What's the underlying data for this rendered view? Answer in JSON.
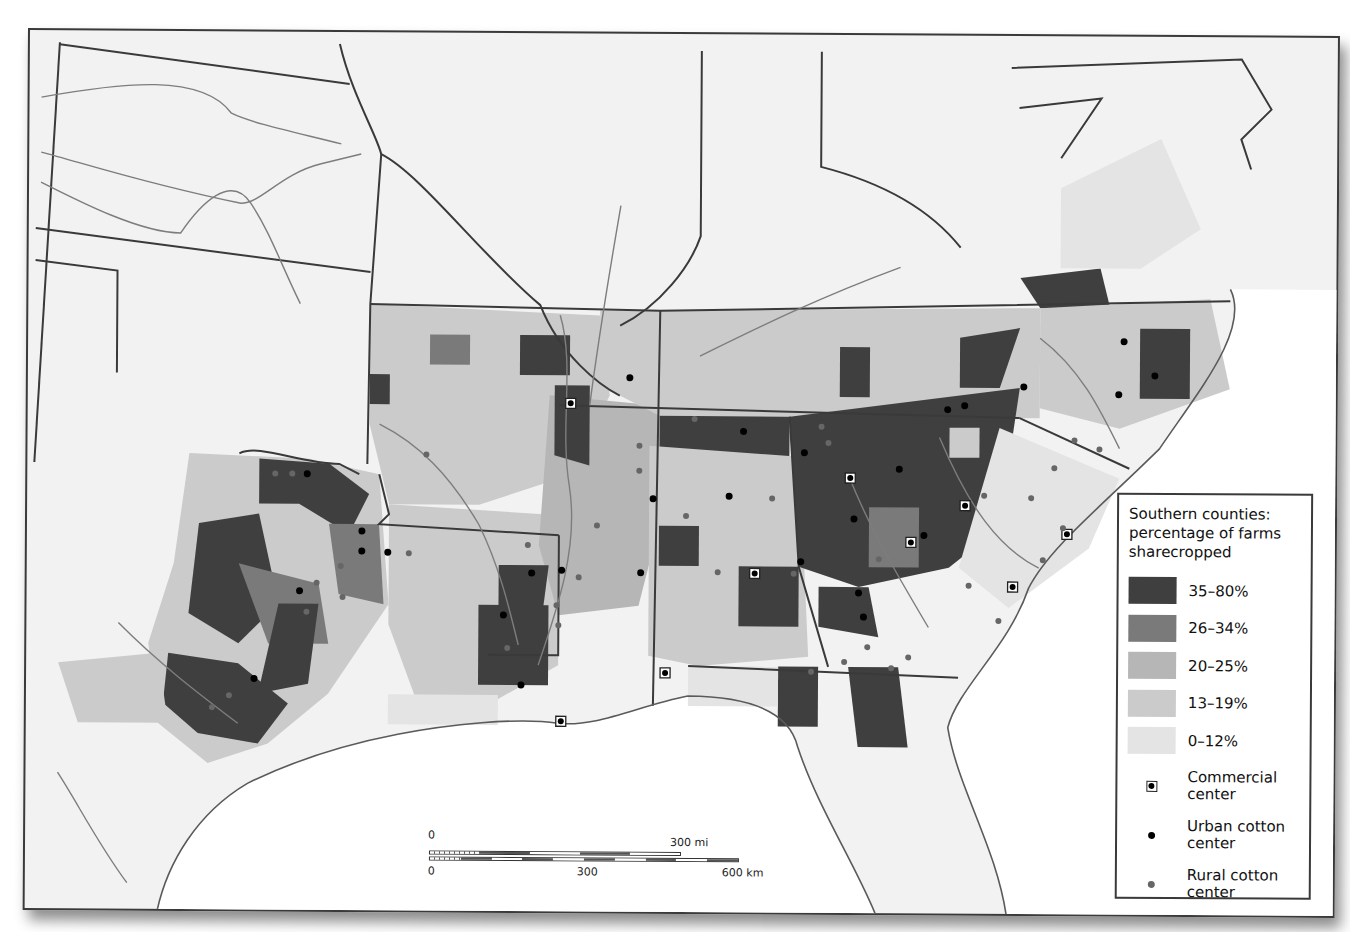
{
  "legend": {
    "title": "Southern counties: percentage of farms sharecropped",
    "classes": [
      {
        "label": "35–80%",
        "color": "#3f3f3f"
      },
      {
        "label": "26–34%",
        "color": "#7a7a7a"
      },
      {
        "label": "20–25%",
        "color": "#b6b6b6"
      },
      {
        "label": "13–19%",
        "color": "#cbcbcb"
      },
      {
        "label": "0–12%",
        "color": "#e4e4e4"
      }
    ],
    "markers": [
      {
        "label": "Commercial center",
        "icon": "commercial-center-marker"
      },
      {
        "label": "Urban cotton center",
        "icon": "urban-cotton-center-dot"
      },
      {
        "label": "Rural cotton center",
        "icon": "rural-cotton-center-dot"
      }
    ]
  },
  "scale": {
    "mi_start": "0",
    "mi_end": "300 mi",
    "km_start": "0",
    "km_mid": "300",
    "km_end": "600 km"
  },
  "colors": {
    "background": "#f2f2f2",
    "water": "#ffffff",
    "state_border": "#3a3a3a",
    "river": "#7d7d7d"
  }
}
